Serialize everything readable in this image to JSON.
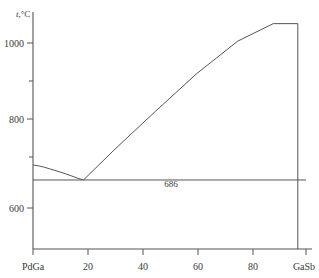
{
  "chart_data": {
    "type": "line",
    "title": "",
    "subtitle": "",
    "xlabel": "",
    "ylabel": "t,°C",
    "ylabel_symbol": "t",
    "ylabel_unit": ",°C",
    "xlim": [
      0,
      100
    ],
    "ylim": [
      520,
      1090
    ],
    "grid": false,
    "legend": null,
    "x_tick_values": [
      0,
      20,
      40,
      60,
      80,
      100
    ],
    "x_tick_labels": [
      "PdGa",
      "20",
      "40",
      "60",
      "80",
      "GaSb"
    ],
    "x_end_label_left": "PdGa",
    "x_end_label_right": "GaSb",
    "y_tick_values": [
      600,
      700,
      800,
      900,
      1000
    ],
    "y_tick_labels": [
      "600",
      "",
      "800",
      "",
      "1000"
    ],
    "y_labeled_ticks": [
      "600",
      "800",
      "1000"
    ],
    "annotations": [
      {
        "name": "eutectic-temperature-label",
        "text": "686",
        "x": 41,
        "y": 665
      }
    ],
    "series": [
      {
        "name": "liquidus-left-branch",
        "style": "solid",
        "points": [
          [
            0,
            722
          ],
          [
            2,
            720
          ],
          [
            4,
            717
          ],
          [
            6,
            713
          ],
          [
            8,
            709
          ],
          [
            11,
            703
          ],
          [
            14,
            696
          ],
          [
            16.5,
            690
          ],
          [
            18.5,
            686
          ]
        ]
      },
      {
        "name": "liquidus-right-branch",
        "style": "solid",
        "points": [
          [
            18.5,
            686
          ],
          [
            30,
            760
          ],
          [
            45,
            852
          ],
          [
            60,
            942
          ],
          [
            75,
            1020
          ],
          [
            88,
            1062
          ],
          [
            97,
            1062
          ]
        ]
      },
      {
        "name": "invariant-horizontal-686",
        "style": "solid",
        "points": [
          [
            0,
            686
          ],
          [
            100,
            686
          ]
        ]
      },
      {
        "name": "gasb-vertical-boundary",
        "style": "solid",
        "points": [
          [
            97,
            520
          ],
          [
            97,
            1062
          ]
        ]
      }
    ]
  }
}
